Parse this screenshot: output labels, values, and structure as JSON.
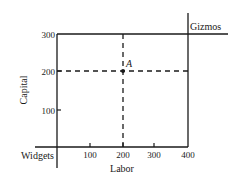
{
  "diagram": {
    "corners": {
      "bottom_left": "Widgets",
      "top_right": "Gizmos"
    },
    "x_axis": {
      "label": "Labor",
      "ticks": [
        "100",
        "200",
        "300",
        "400"
      ]
    },
    "y_axis": {
      "label": "Capital",
      "ticks": [
        "100",
        "200",
        "300"
      ]
    },
    "point": {
      "label": "A",
      "labor": 200,
      "capital": 200
    },
    "colors": {
      "line": "#1a1a1a",
      "background": "#ffffff"
    }
  }
}
